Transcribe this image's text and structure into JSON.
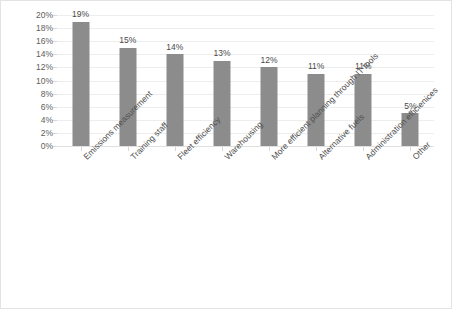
{
  "chart_data": {
    "type": "bar",
    "title": "",
    "subtitle": "",
    "xlabel": "",
    "ylabel": "",
    "ylim": [
      0,
      20
    ],
    "ytick_step": 2,
    "ytick_labels": [
      "0%",
      "2%",
      "4%",
      "6%",
      "8%",
      "10%",
      "12%",
      "14%",
      "16%",
      "18%",
      "20%"
    ],
    "grid": true,
    "legend": false,
    "legend_position": "none",
    "orientation": "vertical",
    "bar_color": "#8c8c8c",
    "value_suffix": "%",
    "categories": [
      "Emissions measurement",
      "Training staff",
      "Fleet efficiency",
      "Warehousing",
      "More efficient planning through IT tools",
      "Alternative fuels",
      "Administration efficienices",
      "Other"
    ],
    "values": [
      19,
      15,
      14,
      13,
      12,
      11,
      11,
      5
    ],
    "data_labels": [
      "19%",
      "15%",
      "14%",
      "13%",
      "12%",
      "11%",
      "11%",
      "5%"
    ]
  },
  "colors": {
    "bar": "#8c8c8c",
    "gridline": "#ededed",
    "tick_text": "#5e5e5e",
    "label_text": "#4f4f4f",
    "frame_border": "#e3e3e3",
    "background": "#ffffff"
  }
}
